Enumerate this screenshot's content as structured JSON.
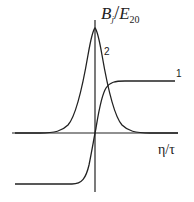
{
  "diagram": {
    "y_axis_label": {
      "main": "B",
      "sub": "j",
      "slash": "/",
      "main2": "E",
      "sub2": "20"
    },
    "x_axis_label": "η/τ",
    "curves": [
      {
        "id": "1",
        "label": "1",
        "shape": "tanh-like step from negative plateau to positive plateau"
      },
      {
        "id": "2",
        "label": "2",
        "shape": "sharp symmetric peak centered on vertical axis"
      }
    ],
    "colors": {
      "line": "#222222",
      "background": "#ffffff"
    }
  }
}
